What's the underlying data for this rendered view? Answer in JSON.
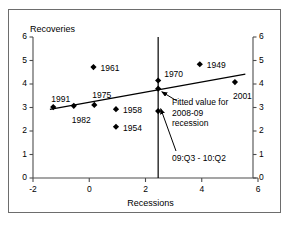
{
  "chart_data": {
    "type": "scatter",
    "title": "",
    "xlabel": "Recessions",
    "ylabel": "Recoveries",
    "xlim": [
      -2,
      6
    ],
    "ylim": [
      0,
      6
    ],
    "xticks": [
      -2,
      0,
      2,
      4,
      6
    ],
    "xtick_labels": [
      "-2",
      "0",
      "2",
      "4",
      "6"
    ],
    "yticks": [
      0,
      1,
      2,
      3,
      4,
      5,
      6
    ],
    "ytick_labels": [
      "0",
      "1",
      "2",
      "3",
      "4",
      "5",
      "6"
    ],
    "right_axis": {
      "visible": true,
      "ticks": [
        0,
        1,
        2,
        3,
        4,
        5,
        6
      ],
      "tick_labels": [
        "0",
        "1",
        "2",
        "3",
        "4",
        "5",
        "6"
      ]
    },
    "grid": false,
    "legend": "none",
    "points": [
      {
        "label": "1991",
        "x": -1.28,
        "y": 3.02,
        "label_dx": -2,
        "label_dy": -13
      },
      {
        "label": "1982",
        "x": -0.55,
        "y": 3.07,
        "label_dx": -2,
        "label_dy": 9
      },
      {
        "label": "1975",
        "x": 0.18,
        "y": 3.11,
        "label_dx": -2,
        "label_dy": -15
      },
      {
        "label": "1961",
        "x": 0.15,
        "y": 4.72,
        "label_dx": 7,
        "label_dy": -4
      },
      {
        "label": "1958",
        "x": 0.95,
        "y": 2.93,
        "label_dx": 7,
        "label_dy": -4
      },
      {
        "label": "1954",
        "x": 0.95,
        "y": 2.18,
        "label_dx": 7,
        "label_dy": -4
      },
      {
        "label": "1970",
        "x": 2.45,
        "y": 4.15,
        "label_dx": 6,
        "label_dy": -11
      },
      {
        "label": "1949",
        "x": 3.93,
        "y": 4.84,
        "label_dx": 7,
        "label_dy": -4
      },
      {
        "label": "2001",
        "x": 5.18,
        "y": 4.08,
        "label_dx": -2,
        "label_dy": 9
      },
      {
        "label": "",
        "x": 2.45,
        "y": 2.85,
        "label_dx": 0,
        "label_dy": 0
      }
    ],
    "fitted_line": {
      "x0": -1.4,
      "y0": 2.92,
      "x1": 5.55,
      "y1": 4.42
    },
    "vertical_line_x": 2.45,
    "fitted_point": {
      "x": 2.45,
      "y": 3.8
    },
    "annotations": [
      {
        "name": "fitted-value-note",
        "text": "Fitted value for 2008-09 recession",
        "lines": [
          "Fitted value for",
          "2008-09",
          "recession"
        ],
        "x": 172,
        "y": 97
      },
      {
        "name": "recession-window-note",
        "text": "09:Q3 - 10:Q2",
        "lines": [
          "09:Q3 - 10:Q2"
        ],
        "x": 172,
        "y": 153
      }
    ],
    "colors": {
      "marker": "#000000",
      "line": "#000000",
      "axis": "#4d4d4d",
      "frame": "#6d6d6d",
      "background": "#ffffff"
    }
  }
}
